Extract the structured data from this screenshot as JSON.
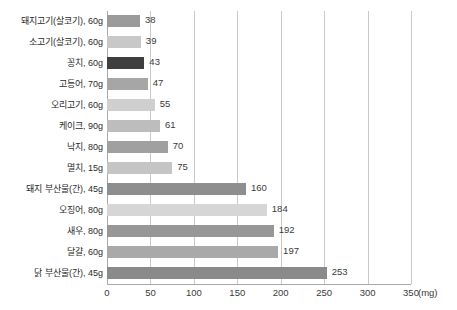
{
  "chart_data": {
    "type": "bar",
    "orientation": "horizontal",
    "title": "",
    "subtitle": "",
    "xlabel": "(mg)",
    "ylabel": "",
    "unit": "mg",
    "xlim": [
      0,
      350
    ],
    "xticks": [
      0,
      50,
      100,
      150,
      200,
      250,
      300,
      350
    ],
    "xtick_labels": [
      "0",
      "50",
      "100",
      "150",
      "200",
      "250",
      "300",
      "350"
    ],
    "grid": "vertical",
    "legend": "none",
    "show_data_labels": true,
    "categories": [
      "돼지고기(살코기), 60g",
      "소고기(살코기), 60g",
      "꽁치, 60g",
      "고등어, 70g",
      "오리고기, 60g",
      "케이크, 90g",
      "낙지, 80g",
      "멸치, 15g",
      "돼지 부산물(간), 45g",
      "오징어, 80g",
      "새우, 80g",
      "달걀, 60g",
      "닭 부산물(간), 45g"
    ],
    "values": [
      38,
      39,
      43,
      47,
      55,
      61,
      70,
      75,
      160,
      184,
      192,
      197,
      253
    ],
    "bar_colors": [
      "#9b9b9b",
      "#c8c8c8",
      "#3f3f3f",
      "#a6a6a6",
      "#cfcfcf",
      "#bdbdbd",
      "#a0a0a0",
      "#c5c5c5",
      "#8e8e8e",
      "#d6d6d6",
      "#979797",
      "#a9a9a9",
      "#8a8a8a"
    ]
  },
  "colors": {
    "background": "#ffffff",
    "gridline": "#c9c9c9",
    "axis": "#a8a8a8",
    "label_text": "#2b2b2b",
    "value_text": "#3a3a3a"
  }
}
